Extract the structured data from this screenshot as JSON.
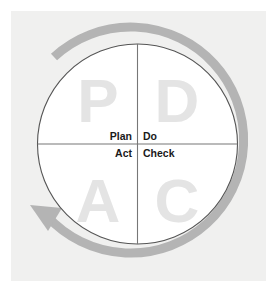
{
  "figure": {
    "panel_bg": "#f0f0ef",
    "page_bg": "#ffffff",
    "circle_fill": "#ffffff",
    "circle_stroke": "#555555",
    "divider_color": "#777777",
    "arrow_color": "#b4b4b4",
    "arrow_direction": "counterclockwise",
    "watermark_color": "#e4e4e4",
    "label_color": "#1a1a1a"
  },
  "quadrants": [
    {
      "id": "plan",
      "letter": "P",
      "label": "Plan",
      "position": "top-left"
    },
    {
      "id": "do",
      "letter": "D",
      "label": "Do",
      "position": "top-right"
    },
    {
      "id": "act",
      "letter": "A",
      "label": "Act",
      "position": "bottom-left"
    },
    {
      "id": "check",
      "letter": "C",
      "label": "Check",
      "position": "bottom-right"
    }
  ]
}
